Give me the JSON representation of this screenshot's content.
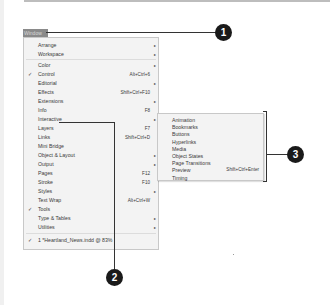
{
  "menu": {
    "title": "Window",
    "items": [
      {
        "label": "Arrange",
        "checked": false,
        "shortcut": "",
        "submenu": true
      },
      {
        "label": "Workspace",
        "checked": false,
        "shortcut": "",
        "submenu": true
      },
      {
        "label": "Color",
        "checked": false,
        "shortcut": "",
        "submenu": true
      },
      {
        "label": "Control",
        "checked": true,
        "shortcut": "Alt+Ctrl+6",
        "submenu": false
      },
      {
        "label": "Editorial",
        "checked": false,
        "shortcut": "",
        "submenu": true
      },
      {
        "label": "Effects",
        "checked": false,
        "shortcut": "Shift+Ctrl+F10",
        "submenu": false
      },
      {
        "label": "Extensions",
        "checked": false,
        "shortcut": "",
        "submenu": true
      },
      {
        "label": "Info",
        "checked": false,
        "shortcut": "F8",
        "submenu": false
      },
      {
        "label": "Interactive",
        "checked": false,
        "shortcut": "",
        "submenu": true
      },
      {
        "label": "Layers",
        "checked": false,
        "shortcut": "F7",
        "submenu": false
      },
      {
        "label": "Links",
        "checked": false,
        "shortcut": "Shift+Ctrl+D",
        "submenu": false
      },
      {
        "label": "Mini Bridge",
        "checked": false,
        "shortcut": "",
        "submenu": false
      },
      {
        "label": "Object & Layout",
        "checked": false,
        "shortcut": "",
        "submenu": true
      },
      {
        "label": "Output",
        "checked": false,
        "shortcut": "",
        "submenu": true
      },
      {
        "label": "Pages",
        "checked": false,
        "shortcut": "F12",
        "submenu": false
      },
      {
        "label": "Stroke",
        "checked": false,
        "shortcut": "F10",
        "submenu": false
      },
      {
        "label": "Styles",
        "checked": false,
        "shortcut": "",
        "submenu": true
      },
      {
        "label": "Text Wrap",
        "checked": false,
        "shortcut": "Alt+Ctrl+W",
        "submenu": false
      },
      {
        "label": "Tools",
        "checked": true,
        "shortcut": "",
        "submenu": false
      },
      {
        "label": "Type & Tables",
        "checked": false,
        "shortcut": "",
        "submenu": true
      },
      {
        "label": "Utilities",
        "checked": false,
        "shortcut": "",
        "submenu": true
      },
      {
        "label": "1 *Heartland_News.indd @ 83%",
        "checked": true,
        "shortcut": "",
        "submenu": false
      }
    ]
  },
  "submenu": {
    "parent": "Interactive",
    "items": [
      {
        "label": "Animation",
        "shortcut": ""
      },
      {
        "label": "Bookmarks",
        "shortcut": ""
      },
      {
        "label": "Buttons",
        "shortcut": ""
      },
      {
        "label": "Hyperlinks",
        "shortcut": ""
      },
      {
        "label": "Media",
        "shortcut": ""
      },
      {
        "label": "Object States",
        "shortcut": ""
      },
      {
        "label": "Page Transitions",
        "shortcut": ""
      },
      {
        "label": "Preview",
        "shortcut": "Shift+Ctrl+Enter"
      },
      {
        "label": "Timing",
        "shortcut": ""
      }
    ]
  },
  "callouts": [
    "1",
    "2",
    "3"
  ],
  "glyphs": {
    "check": "✓",
    "arrow": "▸"
  }
}
